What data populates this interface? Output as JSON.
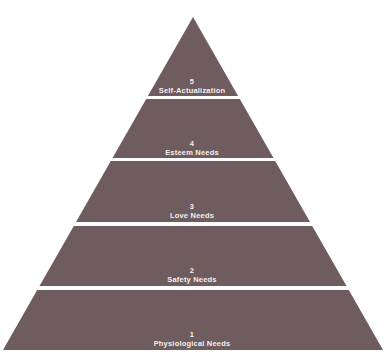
{
  "diagram": {
    "type": "pyramid",
    "fill_color": "#6e5c5e",
    "gap_color": "#ffffff",
    "apex": [
      193,
      17
    ],
    "base_y": 350,
    "base_half_width": 190,
    "tiers": [
      {
        "level": "5",
        "label": "Self-Actualization",
        "top": 17,
        "bottom": 96
      },
      {
        "level": "4",
        "label": "Esteem Needs",
        "top": 99,
        "bottom": 158
      },
      {
        "level": "3",
        "label": "Love Needs",
        "top": 161,
        "bottom": 222
      },
      {
        "level": "2",
        "label": "Safety Needs",
        "top": 226,
        "bottom": 286
      },
      {
        "level": "1",
        "label": "Physiological Needs",
        "top": 290,
        "bottom": 350
      }
    ]
  }
}
